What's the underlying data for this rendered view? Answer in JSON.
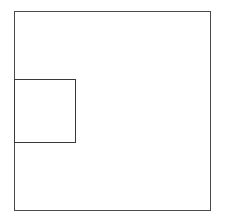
{
  "canvas": {
    "width": 227,
    "height": 217,
    "background_color": "#ffffff",
    "description": "Line drawing of a large square with a smaller square overlapping its lower-left region"
  },
  "figure": {
    "title": "",
    "caption": "",
    "shapes": [
      {
        "id": "outer-square",
        "label": "large square",
        "type": "rectangle",
        "x": 14,
        "y": 11,
        "width": 197,
        "height": 200,
        "stroke_color": "#4a4a4a",
        "stroke_width": 1,
        "fill": "none"
      },
      {
        "id": "inner-square",
        "label": "small square",
        "type": "rectangle",
        "x": 14,
        "y": 79,
        "width": 62,
        "height": 64,
        "stroke_color": "#383838",
        "stroke_width": 1,
        "fill": "none"
      }
    ]
  },
  "labels": {
    "items": []
  }
}
